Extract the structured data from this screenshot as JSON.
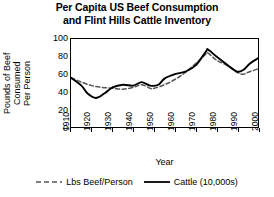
{
  "chart_data": {
    "type": "line",
    "title": "Per Capita US Beef Consumption and Flint Hills Cattle Inventory",
    "title_line1": "Per Capita US Beef Consumption",
    "title_line2": "and Flint Hills Cattle Inventory",
    "xlabel": "Year",
    "ylabel": "Pounds of Beef Consumed Per Person",
    "ylabel_line1": "Pounds of Beef",
    "ylabel_line2": "Consumed",
    "ylabel_line3": "Per Person",
    "xlim": [
      1910,
      2000
    ],
    "ylim": [
      0,
      100
    ],
    "yticks": [
      100,
      80,
      60,
      40,
      20,
      0
    ],
    "xticks": [
      1910,
      1920,
      1930,
      1940,
      1950,
      1960,
      1970,
      1980,
      1990,
      2000
    ],
    "grid": false,
    "legend_position": "bottom",
    "series": [
      {
        "name": "Lbs Beef/Person",
        "style": "dashed",
        "color": "#555555",
        "x": [
          1910,
          1915,
          1920,
          1925,
          1930,
          1935,
          1940,
          1944,
          1948,
          1950,
          1955,
          1960,
          1965,
          1970,
          1975,
          1976,
          1980,
          1985,
          1990,
          1993,
          1995,
          2000
        ],
        "values": [
          56,
          51,
          47,
          45,
          44,
          43,
          45,
          48,
          44,
          44,
          48,
          54,
          62,
          72,
          83,
          84,
          76,
          70,
          62,
          60,
          62,
          66
        ]
      },
      {
        "name": "Cattle (10,000s)",
        "style": "solid",
        "color": "#000000",
        "x": [
          1910,
          1915,
          1918,
          1922,
          1926,
          1930,
          1935,
          1940,
          1944,
          1948,
          1952,
          1955,
          1960,
          1965,
          1970,
          1975,
          1976,
          1980,
          1985,
          1990,
          1993,
          1996,
          2000
        ],
        "values": [
          56,
          47,
          38,
          33,
          38,
          45,
          48,
          47,
          51,
          47,
          48,
          55,
          60,
          63,
          70,
          86,
          88,
          80,
          71,
          63,
          65,
          72,
          78
        ]
      }
    ]
  }
}
